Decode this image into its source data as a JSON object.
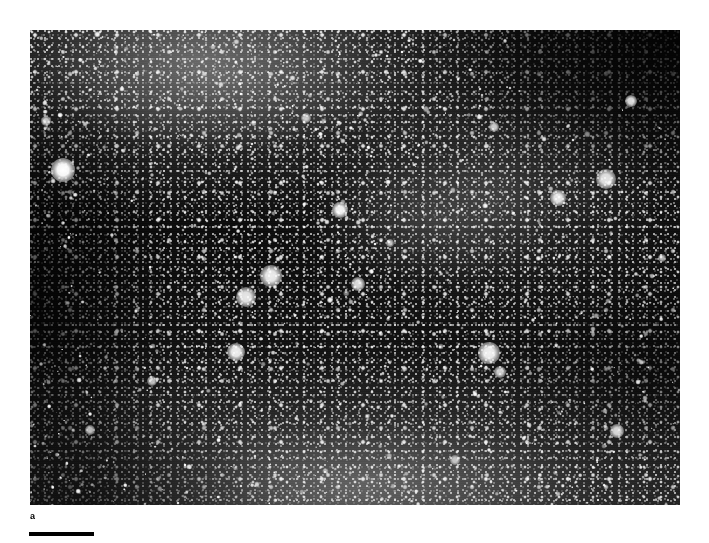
{
  "figure": {
    "background_color": "#ffffff",
    "panel_label": "a",
    "panel_label_position": {
      "x": 30,
      "y": 511
    },
    "scale_bar": {
      "name": "scale-bar",
      "color": "#000000",
      "x": 29,
      "y": 532,
      "width_px": 65,
      "height_px": 4,
      "caption": ""
    },
    "micrograph": {
      "name": "micrograph-panel",
      "x": 30,
      "y": 30,
      "width_px": 650,
      "height_px": 475,
      "modality": "dark-field autoradiograph / fluorescence micrograph",
      "background_color": "#0b0b0b",
      "speckle_color": "#ffffff",
      "description": "Dense field of bright punctate silver grains on a dark background with a diffuse brighter band across the upper-left and a smoother grey haze along the lower edge; upper-right corner is strongly darkened.",
      "bright_features": [
        {
          "name": "large-bright-blob",
          "cx": 63,
          "cy": 170,
          "r": 12,
          "intensity": 1.0
        },
        {
          "name": "bright-blob",
          "cx": 340,
          "cy": 210,
          "r": 8,
          "intensity": 0.95
        },
        {
          "name": "bright-cluster",
          "cx": 271,
          "cy": 276,
          "r": 11,
          "intensity": 0.92
        },
        {
          "name": "bright-cluster",
          "cx": 246,
          "cy": 297,
          "r": 10,
          "intensity": 0.9
        },
        {
          "name": "bright-blob",
          "cx": 358,
          "cy": 284,
          "r": 7,
          "intensity": 0.85
        },
        {
          "name": "bright-blob",
          "cx": 236,
          "cy": 352,
          "r": 9,
          "intensity": 0.93
        },
        {
          "name": "bright-cluster",
          "cx": 489,
          "cy": 353,
          "r": 11,
          "intensity": 0.94
        },
        {
          "name": "bright-blob",
          "cx": 500,
          "cy": 372,
          "r": 6,
          "intensity": 0.8
        },
        {
          "name": "bright-blob",
          "cx": 558,
          "cy": 198,
          "r": 8,
          "intensity": 0.9
        },
        {
          "name": "bright-cluster",
          "cx": 606,
          "cy": 179,
          "r": 10,
          "intensity": 0.88
        },
        {
          "name": "bright-blob",
          "cx": 631,
          "cy": 101,
          "r": 6,
          "intensity": 0.86
        },
        {
          "name": "bright-blob",
          "cx": 617,
          "cy": 431,
          "r": 7,
          "intensity": 0.84
        },
        {
          "name": "bright-blob",
          "cx": 494,
          "cy": 127,
          "r": 5,
          "intensity": 0.78
        },
        {
          "name": "bright-blob",
          "cx": 46,
          "cy": 121,
          "r": 5,
          "intensity": 0.76
        },
        {
          "name": "bright-blob",
          "cx": 152,
          "cy": 381,
          "r": 5,
          "intensity": 0.74
        },
        {
          "name": "bright-blob",
          "cx": 90,
          "cy": 430,
          "r": 5,
          "intensity": 0.72
        },
        {
          "name": "bright-blob",
          "cx": 390,
          "cy": 243,
          "r": 4,
          "intensity": 0.7
        },
        {
          "name": "bright-blob",
          "cx": 306,
          "cy": 118,
          "r": 5,
          "intensity": 0.72
        },
        {
          "name": "bright-blob",
          "cx": 455,
          "cy": 460,
          "r": 5,
          "intensity": 0.7
        },
        {
          "name": "bright-blob",
          "cx": 662,
          "cy": 258,
          "r": 4,
          "intensity": 0.68
        }
      ]
    }
  }
}
